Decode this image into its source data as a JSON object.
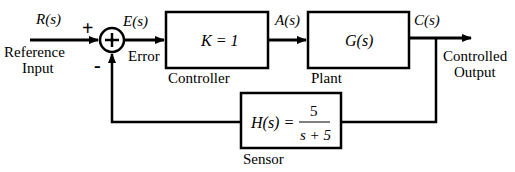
{
  "diagram": {
    "type": "feedback-control-block-diagram",
    "signals": {
      "reference": "R(s)",
      "error": "E(s)",
      "actuating": "A(s)",
      "output": "C(s)"
    },
    "summing_junction": {
      "symbol": "+",
      "input_plus": "+",
      "input_minus": "-"
    },
    "blocks": [
      {
        "id": "controller",
        "expression": "K = 1",
        "label": "Controller"
      },
      {
        "id": "plant",
        "expression": "G(s)",
        "label": "Plant"
      },
      {
        "id": "sensor",
        "expression_lhs": "H(s) =",
        "numerator": "5",
        "denominator": "s + 5",
        "label": "Sensor"
      }
    ],
    "labels": {
      "reference_line1": "Reference",
      "reference_line2": "Input",
      "error": "Error",
      "output_line1": "Controlled",
      "output_line2": "Output"
    },
    "colors": {
      "stroke": "#000000",
      "background": "#ffffff"
    }
  }
}
